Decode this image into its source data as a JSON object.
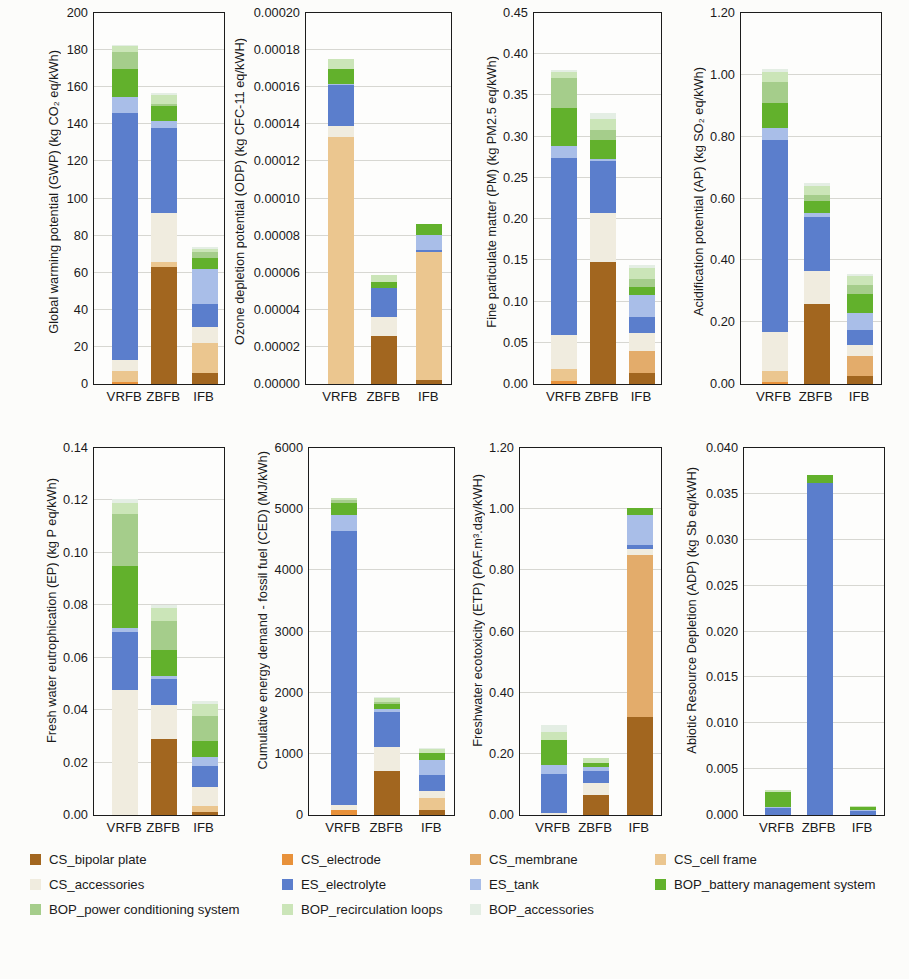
{
  "figure": {
    "background": "#fcfcfa",
    "categories": [
      "VRFB",
      "ZBFB",
      "IFB"
    ],
    "bar_centers_pct": [
      24,
      54,
      85
    ]
  },
  "segments": {
    "order": [
      "cs_bipolar_plate",
      "cs_electrode",
      "cs_membrane",
      "cs_cell_frame",
      "cs_accessories",
      "es_electrolyte",
      "es_tank",
      "bop_battery_management_system",
      "bop_power_conditioning_system",
      "bop_recirculation_loops",
      "bop_accessories"
    ],
    "defs": {
      "cs_bipolar_plate": {
        "label": "CS_bipolar plate",
        "color": "#a2661f"
      },
      "cs_electrode": {
        "label": "CS_electrode",
        "color": "#e8913a"
      },
      "cs_membrane": {
        "label": "CS_membrane",
        "color": "#e3ac6b"
      },
      "cs_cell_frame": {
        "label": "CS_cell frame",
        "color": "#ebc68f"
      },
      "cs_accessories": {
        "label": "CS_accessories",
        "color": "#f0ecdf"
      },
      "es_electrolyte": {
        "label": "ES_electrolyte",
        "color": "#5b7ecc"
      },
      "es_tank": {
        "label": "ES_tank",
        "color": "#a9bee8"
      },
      "bop_battery_management_system": {
        "label": "BOP_battery management system",
        "color": "#62b12c"
      },
      "bop_power_conditioning_system": {
        "label": "BOP_power conditioning system",
        "color": "#a5cd8b"
      },
      "bop_recirculation_loops": {
        "label": "BOP_recirculation loops",
        "color": "#cbe5b8"
      },
      "bop_accessories": {
        "label": "BOP_accessories",
        "color": "#e4eee4"
      }
    }
  },
  "legend": {
    "columns": [
      [
        "cs_bipolar_plate",
        "cs_accessories",
        "bop_power_conditioning_system"
      ],
      [
        "cs_electrode",
        "es_electrolyte",
        "bop_recirculation_loops"
      ],
      [
        "cs_membrane",
        "es_tank",
        "bop_accessories"
      ],
      [
        "cs_cell_frame",
        "bop_battery_management_system"
      ]
    ]
  },
  "chart_data": [
    {
      "type": "bar",
      "stacked": true,
      "ylabel": "Global warming potential (GWP) (kg CO₂ eq/kWh)",
      "ylim": [
        0,
        200
      ],
      "ytick_step": 20,
      "ytick_decimals": 0,
      "grid": true,
      "categories": [
        "VRFB",
        "ZBFB",
        "IFB"
      ],
      "series": [
        {
          "key": "cs_bipolar_plate",
          "values": [
            0,
            63,
            6
          ]
        },
        {
          "key": "cs_electrode",
          "values": [
            1,
            0,
            0
          ]
        },
        {
          "key": "cs_membrane",
          "values": [
            0,
            0,
            0
          ]
        },
        {
          "key": "cs_cell_frame",
          "values": [
            6,
            3,
            16
          ]
        },
        {
          "key": "cs_accessories",
          "values": [
            6,
            26,
            9
          ]
        },
        {
          "key": "es_electrolyte",
          "values": [
            133,
            46,
            12
          ]
        },
        {
          "key": "es_tank",
          "values": [
            9,
            4,
            19
          ]
        },
        {
          "key": "bop_battery_management_system",
          "values": [
            15,
            8,
            6
          ]
        },
        {
          "key": "bop_power_conditioning_system",
          "values": [
            9,
            1,
            3
          ]
        },
        {
          "key": "bop_recirculation_loops",
          "values": [
            3,
            5,
            2
          ]
        },
        {
          "key": "bop_accessories",
          "values": [
            1,
            1,
            1
          ]
        }
      ]
    },
    {
      "type": "bar",
      "stacked": true,
      "ylabel": "Ozone depletion potential (ODP) (kg CFC-11 eq/kWH)",
      "ylim": [
        0,
        0.0002
      ],
      "ytick_step": 2e-05,
      "ytick_decimals": 5,
      "grid": true,
      "categories": [
        "VRFB",
        "ZBFB",
        "IFB"
      ],
      "series": [
        {
          "key": "cs_bipolar_plate",
          "values": [
            0,
            2.6e-05,
            2e-06
          ]
        },
        {
          "key": "cs_electrode",
          "values": [
            0,
            0,
            0
          ]
        },
        {
          "key": "cs_membrane",
          "values": [
            0,
            0,
            0
          ]
        },
        {
          "key": "cs_cell_frame",
          "values": [
            0.000133,
            0,
            6.9e-05
          ]
        },
        {
          "key": "cs_accessories",
          "values": [
            6e-06,
            1e-05,
            0
          ]
        },
        {
          "key": "es_electrolyte",
          "values": [
            2.2e-05,
            1.6e-05,
            1.5e-06
          ]
        },
        {
          "key": "es_tank",
          "values": [
            1e-06,
            0,
            8e-06
          ]
        },
        {
          "key": "bop_battery_management_system",
          "values": [
            8e-06,
            3e-06,
            6e-06
          ]
        },
        {
          "key": "bop_power_conditioning_system",
          "values": [
            0,
            0,
            0
          ]
        },
        {
          "key": "bop_recirculation_loops",
          "values": [
            5e-06,
            4e-06,
            0
          ]
        },
        {
          "key": "bop_accessories",
          "values": [
            0,
            0,
            0
          ]
        }
      ]
    },
    {
      "type": "bar",
      "stacked": true,
      "ylabel": "Fine particulate matter (PM) (kg PM2.5 eq/kWh)",
      "ylim": [
        0,
        0.45
      ],
      "ytick_step": 0.05,
      "ytick_decimals": 2,
      "grid": true,
      "categories": [
        "VRFB",
        "ZBFB",
        "IFB"
      ],
      "series": [
        {
          "key": "cs_bipolar_plate",
          "values": [
            0,
            0.148,
            0.013
          ]
        },
        {
          "key": "cs_electrode",
          "values": [
            0.004,
            0,
            0
          ]
        },
        {
          "key": "cs_membrane",
          "values": [
            0,
            0,
            0.027
          ]
        },
        {
          "key": "cs_cell_frame",
          "values": [
            0.014,
            0,
            0
          ]
        },
        {
          "key": "cs_accessories",
          "values": [
            0.042,
            0.059,
            0.022
          ]
        },
        {
          "key": "es_electrolyte",
          "values": [
            0.214,
            0.064,
            0.019
          ]
        },
        {
          "key": "es_tank",
          "values": [
            0.015,
            0.002,
            0.027
          ]
        },
        {
          "key": "bop_battery_management_system",
          "values": [
            0.046,
            0.023,
            0.01
          ]
        },
        {
          "key": "bop_power_conditioning_system",
          "values": [
            0.036,
            0.012,
            0.009
          ]
        },
        {
          "key": "bop_recirculation_loops",
          "values": [
            0.007,
            0.014,
            0.014
          ]
        },
        {
          "key": "bop_accessories",
          "values": [
            0.003,
            0.007,
            0.004
          ]
        }
      ]
    },
    {
      "type": "bar",
      "stacked": true,
      "ylabel": "Acidification potential (AP) (kg SO₂ eq/kWh)",
      "ylim": [
        0,
        1.2
      ],
      "ytick_step": 0.2,
      "ytick_decimals": 2,
      "grid": true,
      "categories": [
        "VRFB",
        "ZBFB",
        "IFB"
      ],
      "series": [
        {
          "key": "cs_bipolar_plate",
          "values": [
            0,
            0.26,
            0.025
          ]
        },
        {
          "key": "cs_electrode",
          "values": [
            0.008,
            0,
            0
          ]
        },
        {
          "key": "cs_membrane",
          "values": [
            0,
            0,
            0.065
          ]
        },
        {
          "key": "cs_cell_frame",
          "values": [
            0.035,
            0,
            0
          ]
        },
        {
          "key": "cs_accessories",
          "values": [
            0.125,
            0.105,
            0.035
          ]
        },
        {
          "key": "es_electrolyte",
          "values": [
            0.62,
            0.175,
            0.05
          ]
        },
        {
          "key": "es_tank",
          "values": [
            0.04,
            0.012,
            0.055
          ]
        },
        {
          "key": "bop_battery_management_system",
          "values": [
            0.08,
            0.04,
            0.06
          ]
        },
        {
          "key": "bop_power_conditioning_system",
          "values": [
            0.07,
            0.02,
            0.03
          ]
        },
        {
          "key": "bop_recirculation_loops",
          "values": [
            0.03,
            0.028,
            0.028
          ]
        },
        {
          "key": "bop_accessories",
          "values": [
            0.012,
            0.01,
            0.007
          ]
        }
      ]
    },
    {
      "type": "bar",
      "stacked": true,
      "ylabel": "Fresh water eutrophication (EP) (kg P eq/kWh)",
      "ylim": [
        0,
        0.14
      ],
      "ytick_step": 0.02,
      "ytick_decimals": 2,
      "grid": true,
      "categories": [
        "VRFB",
        "ZBFB",
        "IFB"
      ],
      "series": [
        {
          "key": "cs_bipolar_plate",
          "values": [
            0,
            0.029,
            0.001
          ]
        },
        {
          "key": "cs_electrode",
          "values": [
            0,
            0,
            0
          ]
        },
        {
          "key": "cs_membrane",
          "values": [
            0,
            0,
            0
          ]
        },
        {
          "key": "cs_cell_frame",
          "values": [
            0,
            0,
            0.0025
          ]
        },
        {
          "key": "cs_accessories",
          "values": [
            0.0475,
            0.013,
            0.0072
          ]
        },
        {
          "key": "es_electrolyte",
          "values": [
            0.0225,
            0.01,
            0.008
          ]
        },
        {
          "key": "es_tank",
          "values": [
            0.0015,
            0.001,
            0.0035
          ]
        },
        {
          "key": "bop_battery_management_system",
          "values": [
            0.0235,
            0.01,
            0.0062
          ]
        },
        {
          "key": "bop_power_conditioning_system",
          "values": [
            0.02,
            0.011,
            0.0095
          ]
        },
        {
          "key": "bop_recirculation_loops",
          "values": [
            0.004,
            0.005,
            0.0046
          ]
        },
        {
          "key": "bop_accessories",
          "values": [
            0.0015,
            0.001,
            0.001
          ]
        }
      ]
    },
    {
      "type": "bar",
      "stacked": true,
      "ylabel": "Cumulative energy demand - fossil fuel (CED) (MJ/kWh)",
      "ylim": [
        0,
        6000
      ],
      "ytick_step": 1000,
      "ytick_decimals": 0,
      "grid": true,
      "categories": [
        "VRFB",
        "ZBFB",
        "IFB"
      ],
      "series": [
        {
          "key": "cs_bipolar_plate",
          "values": [
            0,
            720,
            80
          ]
        },
        {
          "key": "cs_electrode",
          "values": [
            80,
            0,
            0
          ]
        },
        {
          "key": "cs_membrane",
          "values": [
            0,
            0,
            0
          ]
        },
        {
          "key": "cs_cell_frame",
          "values": [
            0,
            0,
            200
          ]
        },
        {
          "key": "cs_accessories",
          "values": [
            90,
            400,
            120
          ]
        },
        {
          "key": "es_electrolyte",
          "values": [
            4480,
            560,
            250
          ]
        },
        {
          "key": "es_tank",
          "values": [
            250,
            60,
            250
          ]
        },
        {
          "key": "bop_battery_management_system",
          "values": [
            200,
            80,
            120
          ]
        },
        {
          "key": "bop_power_conditioning_system",
          "values": [
            50,
            30,
            0
          ]
        },
        {
          "key": "bop_recirculation_loops",
          "values": [
            30,
            70,
            60
          ]
        },
        {
          "key": "bop_accessories",
          "values": [
            0,
            10,
            10
          ]
        }
      ]
    },
    {
      "type": "bar",
      "stacked": true,
      "ylabel": "Freshwater ecotoxicity (ETP) (PAF.m³.day/kWH)",
      "ylim": [
        0,
        1.2
      ],
      "ytick_step": 0.2,
      "ytick_decimals": 2,
      "grid": true,
      "categories": [
        "VRFB",
        "ZBFB",
        "IFB"
      ],
      "series": [
        {
          "key": "cs_bipolar_plate",
          "values": [
            0,
            0.065,
            0.32
          ]
        },
        {
          "key": "cs_electrode",
          "values": [
            0,
            0,
            0
          ]
        },
        {
          "key": "cs_membrane",
          "values": [
            0,
            0,
            0.53
          ]
        },
        {
          "key": "cs_cell_frame",
          "values": [
            0,
            0,
            0
          ]
        },
        {
          "key": "cs_accessories",
          "values": [
            0.005,
            0.04,
            0.02
          ]
        },
        {
          "key": "es_electrolyte",
          "values": [
            0.13,
            0.04,
            0.012
          ]
        },
        {
          "key": "es_tank",
          "values": [
            0.03,
            0.012,
            0.1
          ]
        },
        {
          "key": "bop_battery_management_system",
          "values": [
            0.08,
            0.012,
            0.022
          ]
        },
        {
          "key": "bop_power_conditioning_system",
          "values": [
            0,
            0,
            0
          ]
        },
        {
          "key": "bop_recirculation_loops",
          "values": [
            0.025,
            0.016,
            0
          ]
        },
        {
          "key": "bop_accessories",
          "values": [
            0.025,
            0,
            0
          ]
        }
      ]
    },
    {
      "type": "bar",
      "stacked": true,
      "ylabel": "Abiotic Resource Depletion (ADP) (kg Sb eq/kWH)",
      "ylim": [
        0,
        0.04
      ],
      "ytick_step": 0.005,
      "ytick_decimals": 3,
      "grid": true,
      "categories": [
        "VRFB",
        "ZBFB",
        "IFB"
      ],
      "series": [
        {
          "key": "cs_bipolar_plate",
          "values": [
            0,
            0,
            0
          ]
        },
        {
          "key": "cs_electrode",
          "values": [
            0,
            0,
            0
          ]
        },
        {
          "key": "cs_membrane",
          "values": [
            0,
            0,
            0
          ]
        },
        {
          "key": "cs_cell_frame",
          "values": [
            0,
            0,
            0
          ]
        },
        {
          "key": "cs_accessories",
          "values": [
            0,
            0,
            0
          ]
        },
        {
          "key": "es_electrolyte",
          "values": [
            0.0008,
            0.0362,
            0.0004
          ]
        },
        {
          "key": "es_tank",
          "values": [
            0.0001,
            0,
            0.0001
          ]
        },
        {
          "key": "bop_battery_management_system",
          "values": [
            0.0016,
            0.0009,
            0.0004
          ]
        },
        {
          "key": "bop_power_conditioning_system",
          "values": [
            0,
            0,
            0
          ]
        },
        {
          "key": "bop_recirculation_loops",
          "values": [
            0.0002,
            0,
            0.0001
          ]
        },
        {
          "key": "bop_accessories",
          "values": [
            0,
            0,
            0
          ]
        }
      ]
    }
  ]
}
